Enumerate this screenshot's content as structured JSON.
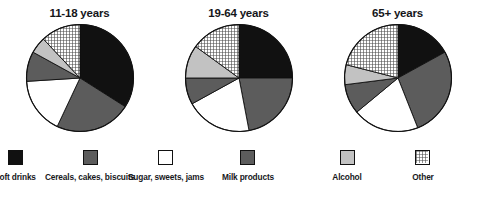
{
  "figure": {
    "background": "#ffffff",
    "outline_color": "#111111"
  },
  "legend": {
    "position": "bottom",
    "items": [
      {
        "key": "soft_drinks",
        "label": "Soft drinks",
        "color": "#111111",
        "pattern": "solid",
        "swatch_name": "legend-swatch-soft-drinks",
        "x": 15
      },
      {
        "key": "cereals",
        "label": "Cereals, cakes, biscuits",
        "color": "#5c5c5c",
        "pattern": "solid",
        "swatch_name": "legend-swatch-cereals",
        "x": 90
      },
      {
        "key": "sugar",
        "label": "Sugar, sweets, jams",
        "color": "#ffffff",
        "pattern": "solid",
        "swatch_name": "legend-swatch-sugar",
        "x": 166
      },
      {
        "key": "milk",
        "label": "Milk products",
        "color": "#5c5c5c",
        "pattern": "solid",
        "swatch_name": "legend-swatch-milk",
        "x": 248
      },
      {
        "key": "alcohol",
        "label": "Alcohol",
        "color": "#c2c2c2",
        "pattern": "solid",
        "swatch_name": "legend-swatch-alcohol",
        "x": 347
      },
      {
        "key": "other",
        "label": "Other",
        "color": "#b8b8b8",
        "pattern": "crosshatch",
        "swatch_name": "legend-swatch-other",
        "x": 423
      }
    ]
  },
  "chart_data": [
    {
      "type": "pie",
      "title": "11-18 years",
      "xlabel": "",
      "ylabel": "",
      "start_angle": 0,
      "direction": "clockwise",
      "categories": [
        "Soft drinks",
        "Cereals, cakes, biscuits",
        "Sugar, sweets, jams",
        "Milk products",
        "Alcohol",
        "Other"
      ],
      "values": [
        34,
        23,
        17,
        9,
        5,
        12
      ],
      "units": "percent"
    },
    {
      "type": "pie",
      "title": "19-64 years",
      "xlabel": "",
      "ylabel": "",
      "start_angle": 0,
      "direction": "clockwise",
      "categories": [
        "Soft drinks",
        "Cereals, cakes, biscuits",
        "Sugar, sweets, jams",
        "Milk products",
        "Alcohol",
        "Other"
      ],
      "values": [
        25,
        22,
        20,
        8,
        10,
        15
      ],
      "units": "percent"
    },
    {
      "type": "pie",
      "title": "65+ years",
      "xlabel": "",
      "ylabel": "",
      "start_angle": 0,
      "direction": "clockwise",
      "categories": [
        "Soft drinks",
        "Cereals, cakes, biscuits",
        "Sugar, sweets, jams",
        "Milk products",
        "Alcohol",
        "Other"
      ],
      "values": [
        17,
        27,
        20,
        9,
        6,
        21
      ],
      "units": "percent"
    }
  ]
}
